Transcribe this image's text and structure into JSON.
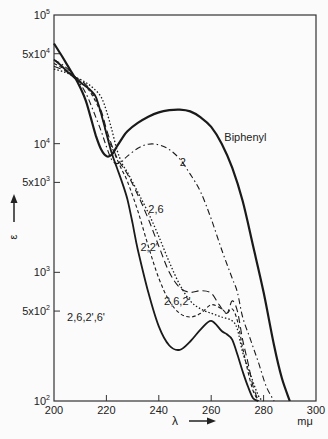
{
  "chart_data": {
    "type": "line",
    "title": "",
    "xlabel": "λ",
    "xunit": "mμ",
    "ylabel": "ε",
    "yscale": "log",
    "xlim": [
      200,
      300
    ],
    "ylim": [
      100,
      100000
    ],
    "grid": false,
    "x_ticks": [
      200,
      220,
      240,
      260,
      280,
      300
    ],
    "x_tick_labels": [
      "200",
      "220",
      "240",
      "260",
      "280",
      "300"
    ],
    "y_ticks": [
      {
        "value": 100000,
        "base": "10",
        "exp": "5",
        "prefix": ""
      },
      {
        "value": 50000,
        "base": "10",
        "exp": "4",
        "prefix": "5x"
      },
      {
        "value": 10000,
        "base": "10",
        "exp": "4",
        "prefix": ""
      },
      {
        "value": 5000,
        "base": "10",
        "exp": "3",
        "prefix": "5x"
      },
      {
        "value": 1000,
        "base": "10",
        "exp": "3",
        "prefix": ""
      },
      {
        "value": 500,
        "base": "10",
        "exp": "2",
        "prefix": "5x"
      },
      {
        "value": 100,
        "base": "10",
        "exp": "2",
        "prefix": ""
      }
    ],
    "series": [
      {
        "name": "Biphenyl",
        "style": "solid-thick",
        "x": [
          200,
          203,
          206,
          209,
          212,
          214,
          216,
          218,
          220,
          222,
          224,
          226,
          228,
          232,
          236,
          240,
          244,
          248,
          252,
          256,
          260,
          264,
          268,
          272,
          276,
          280,
          284,
          287,
          290
        ],
        "y": [
          60000,
          48000,
          38000,
          30000,
          22000,
          16000,
          11500,
          9000,
          8000,
          8200,
          9500,
          11000,
          12500,
          14500,
          16200,
          17500,
          18200,
          18400,
          17800,
          16000,
          13500,
          10000,
          6500,
          3600,
          1600,
          700,
          270,
          150,
          100
        ]
      },
      {
        "name": "2",
        "style": "dash-dot",
        "x": [
          200,
          204,
          208,
          212,
          215,
          218,
          220,
          222,
          224,
          226,
          228,
          232,
          236,
          240,
          244,
          248,
          252,
          256,
          260,
          264,
          268,
          270,
          272,
          275,
          278,
          281,
          284
        ],
        "y": [
          45000,
          40000,
          33000,
          25000,
          18000,
          12500,
          9500,
          7500,
          7000,
          7300,
          8000,
          9200,
          9900,
          9800,
          9000,
          7600,
          5800,
          4200,
          2600,
          1500,
          900,
          700,
          450,
          300,
          200,
          130,
          100
        ]
      },
      {
        "name": "2,6",
        "style": "dotted",
        "x": [
          200,
          204,
          208,
          212,
          215,
          218,
          220,
          222,
          224,
          226,
          228,
          232,
          236,
          240,
          244,
          248,
          252,
          256,
          260,
          264,
          268,
          270,
          272,
          275,
          278,
          280
        ],
        "y": [
          38000,
          36000,
          33000,
          30000,
          27000,
          23000,
          18000,
          13000,
          9000,
          7000,
          6000,
          4200,
          2900,
          1900,
          1200,
          800,
          600,
          520,
          480,
          450,
          420,
          360,
          240,
          160,
          110,
          100
        ]
      },
      {
        "name": "2,2'",
        "style": "long-dash",
        "x": [
          200,
          204,
          208,
          212,
          215,
          218,
          220,
          222,
          224,
          226,
          228,
          232,
          236,
          240,
          244,
          248,
          252,
          256,
          260,
          263,
          266,
          268,
          270,
          272,
          274,
          276,
          278
        ],
        "y": [
          40000,
          37000,
          33000,
          29000,
          24000,
          18000,
          13000,
          9800,
          7800,
          6700,
          5800,
          4000,
          2600,
          1600,
          1000,
          760,
          700,
          720,
          690,
          560,
          480,
          600,
          500,
          300,
          200,
          130,
          100
        ]
      },
      {
        "name": "2,6,2'",
        "style": "short-dash",
        "x": [
          200,
          204,
          208,
          212,
          215,
          218,
          220,
          222,
          224,
          226,
          228,
          232,
          236,
          240,
          244,
          248,
          252,
          256,
          260,
          264,
          266,
          268,
          270,
          272,
          274,
          276,
          278
        ],
        "y": [
          42000,
          38000,
          33000,
          28000,
          23000,
          17000,
          12000,
          9500,
          7600,
          6200,
          5100,
          3000,
          1600,
          900,
          600,
          480,
          450,
          480,
          560,
          520,
          480,
          520,
          420,
          260,
          170,
          120,
          100
        ]
      },
      {
        "name": "2,6,2',6'",
        "style": "solid",
        "x": [
          200,
          203,
          206,
          209,
          212,
          214,
          216,
          218,
          220,
          222,
          224,
          226,
          228,
          230,
          232,
          236,
          240,
          244,
          248,
          252,
          256,
          260,
          264,
          266,
          268,
          270,
          272,
          274,
          276,
          278
        ],
        "y": [
          45000,
          40000,
          35000,
          31000,
          28000,
          26000,
          23000,
          17000,
          12000,
          8500,
          6500,
          5000,
          3700,
          2400,
          1500,
          700,
          380,
          270,
          250,
          290,
          360,
          420,
          350,
          330,
          300,
          230,
          170,
          130,
          105,
          100
        ]
      }
    ],
    "annotations": [
      {
        "text": "Biphenyl",
        "x": 265,
        "y": 10500
      },
      {
        "text": "2",
        "x": 248,
        "y": 6700
      },
      {
        "text": "2,6",
        "x": 236,
        "y": 2900
      },
      {
        "text": "2,2'",
        "x": 233,
        "y": 1470
      },
      {
        "text": "2,6,2'",
        "x": 242,
        "y": 560
      },
      {
        "text": "2,6,2',6'",
        "x": 205,
        "y": 420
      }
    ],
    "axis_arrow_x": "→",
    "axis_arrow_y": "↑"
  }
}
